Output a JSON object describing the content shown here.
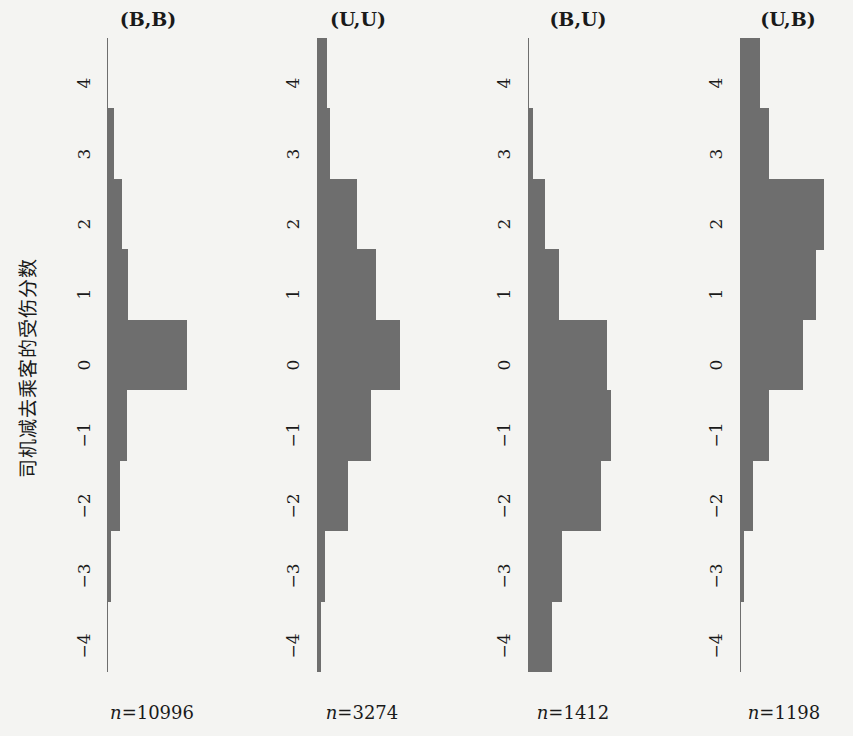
{
  "chart_data": {
    "type": "bar",
    "orientation": "horizontal-histogram",
    "ylabel": "司机减去乘客的受伤分数",
    "categories": [
      4,
      3,
      2,
      1,
      0,
      -1,
      -2,
      -3,
      -4
    ],
    "tick_labels": [
      "4",
      "3",
      "2",
      "1",
      "0",
      "−1",
      "−2",
      "−3",
      "−4"
    ],
    "units": "relative bar length (px)",
    "panels": [
      {
        "title": "(B,B)",
        "n_label": "n=10996",
        "n": 10996,
        "values": [
          1,
          7,
          15,
          21,
          80,
          20,
          13,
          4,
          1
        ]
      },
      {
        "title": "(U,U)",
        "n_label": "n=3274",
        "n": 3274,
        "values": [
          10,
          13,
          40,
          59,
          83,
          54,
          31,
          8,
          4
        ]
      },
      {
        "title": "(B,U)",
        "n_label": "n=1412",
        "n": 1412,
        "values": [
          1,
          5,
          17,
          31,
          79,
          83,
          73,
          34,
          24
        ]
      },
      {
        "title": "(U,B)",
        "n_label": "n=1198",
        "n": 1198,
        "values": [
          20,
          29,
          84,
          76,
          63,
          29,
          13,
          4,
          1
        ]
      }
    ],
    "grid": false,
    "legend": null
  },
  "labels": {
    "ylabel": "司机减去乘客的受伤分数",
    "n_prefix": "n",
    "p0_title": "(B,B)",
    "p0_n": "=10996",
    "p1_title": "(U,U)",
    "p1_n": "=3274",
    "p2_title": "(B,U)",
    "p2_n": "=1412",
    "p3_title": "(U,B)",
    "p3_n": "=1198"
  }
}
